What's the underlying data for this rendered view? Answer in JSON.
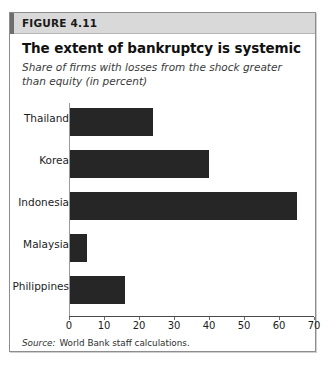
{
  "figure": {
    "number": "FIGURE 4.11",
    "title": "The extent of bankruptcy is systemic",
    "subtitle": "Share of firms with losses from the shock greater than equity (in percent)",
    "source_label": "Source:",
    "source_text": "World Bank staff calculations."
  },
  "chart_data": {
    "type": "bar",
    "orientation": "horizontal",
    "title": "The extent of bankruptcy is systemic",
    "subtitle": "Share of firms with losses from the shock greater than equity (in percent)",
    "categories": [
      "Thailand",
      "Korea",
      "Indonesia",
      "Malaysia",
      "Philippines"
    ],
    "values": [
      24,
      40,
      65,
      5,
      16
    ],
    "xlabel": "",
    "ylabel": "",
    "xlim": [
      0,
      70
    ],
    "xticks": [
      0,
      10,
      20,
      30,
      40,
      50,
      60,
      70
    ],
    "xtick_labels": [
      "0",
      "10",
      "20",
      "30",
      "40",
      "50",
      "60",
      "70"
    ],
    "grid": false,
    "legend": false,
    "bar_color": "#262626"
  }
}
